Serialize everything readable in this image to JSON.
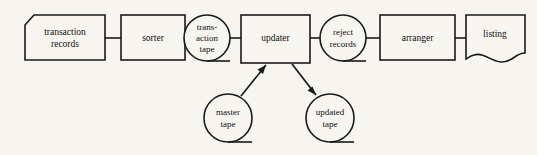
{
  "diagram": {
    "background_color": "#f7f5ef",
    "line_color": "#1a1a1a",
    "nodes": {
      "transaction_records": {
        "label_line1": "transaction",
        "label_line2": "records",
        "shape": "punched-card"
      },
      "sorter": {
        "label": "sorter",
        "shape": "process-rectangle"
      },
      "transaction_tape": {
        "label_line1": "trans-",
        "label_line2": "action",
        "label_line3": "tape",
        "shape": "magnetic-tape"
      },
      "updater": {
        "label": "updater",
        "shape": "process-rectangle"
      },
      "reject_records": {
        "label_line1": "reject",
        "label_line2": "records",
        "shape": "magnetic-tape"
      },
      "arranger": {
        "label": "arranger",
        "shape": "process-rectangle"
      },
      "listing": {
        "label": "listing",
        "shape": "document"
      },
      "master_tape": {
        "label_line1": "master",
        "label_line2": "tape",
        "shape": "magnetic-tape"
      },
      "updated_tape": {
        "label_line1": "updated",
        "label_line2": "tape",
        "shape": "magnetic-tape"
      }
    },
    "connections": [
      {
        "from": "transaction_records",
        "to": "sorter",
        "style": "line"
      },
      {
        "from": "sorter",
        "to": "transaction_tape",
        "style": "line"
      },
      {
        "from": "transaction_tape",
        "to": "updater",
        "style": "line"
      },
      {
        "from": "updater",
        "to": "reject_records",
        "style": "line"
      },
      {
        "from": "reject_records",
        "to": "arranger",
        "style": "line"
      },
      {
        "from": "arranger",
        "to": "listing",
        "style": "line"
      },
      {
        "from": "master_tape",
        "to": "updater",
        "style": "arrow"
      },
      {
        "from": "updater",
        "to": "updated_tape",
        "style": "arrow"
      }
    ]
  }
}
